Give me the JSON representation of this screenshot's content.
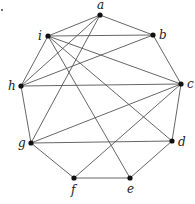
{
  "graph": {
    "nodes": [
      {
        "id": "a",
        "label": "a",
        "x": 100,
        "y": 15,
        "lx": 97,
        "ly": 9
      },
      {
        "id": "b",
        "label": "b",
        "x": 153,
        "y": 35,
        "lx": 159,
        "ly": 39
      },
      {
        "id": "c",
        "label": "c",
        "x": 181,
        "y": 84,
        "lx": 187,
        "ly": 88
      },
      {
        "id": "d",
        "label": "d",
        "x": 172,
        "y": 141,
        "lx": 178,
        "ly": 146
      },
      {
        "id": "e",
        "label": "e",
        "x": 130,
        "y": 178,
        "lx": 127,
        "ly": 193
      },
      {
        "id": "f",
        "label": "f",
        "x": 74,
        "y": 178,
        "lx": 71,
        "ly": 194
      },
      {
        "id": "g",
        "label": "g",
        "x": 31,
        "y": 143,
        "lx": 18,
        "ly": 147
      },
      {
        "id": "h",
        "label": "h",
        "x": 21,
        "y": 86,
        "lx": 8,
        "ly": 90
      },
      {
        "id": "i",
        "label": "i",
        "x": 48,
        "y": 36,
        "lx": 38,
        "ly": 40
      }
    ],
    "edges": [
      [
        "a",
        "b"
      ],
      [
        "a",
        "i"
      ],
      [
        "a",
        "h"
      ],
      [
        "a",
        "g"
      ],
      [
        "b",
        "c"
      ],
      [
        "b",
        "i"
      ],
      [
        "b",
        "h"
      ],
      [
        "c",
        "d"
      ],
      [
        "c",
        "h"
      ],
      [
        "c",
        "i"
      ],
      [
        "c",
        "g"
      ],
      [
        "c",
        "f"
      ],
      [
        "d",
        "e"
      ],
      [
        "d",
        "g"
      ],
      [
        "d",
        "i"
      ],
      [
        "e",
        "f"
      ],
      [
        "e",
        "i"
      ],
      [
        "f",
        "g"
      ],
      [
        "g",
        "h"
      ],
      [
        "h",
        "i"
      ]
    ]
  },
  "colors": {
    "edge": "#555555",
    "node": "#111111",
    "label": "#222222"
  },
  "corner_mark": {
    "x": 2,
    "y": 10
  }
}
